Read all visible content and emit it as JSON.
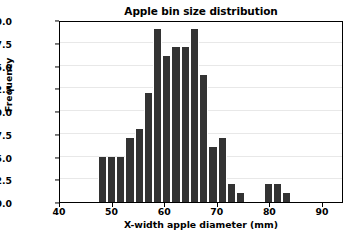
{
  "chart_data": {
    "type": "bar",
    "title": "Apple bin size distribution",
    "xlabel": "X-width apple diameter (mm)",
    "ylabel": "Frequency",
    "xlim": [
      40,
      94
    ],
    "ylim": [
      0,
      20
    ],
    "grid": true,
    "legend": null,
    "bar_color": "#333333",
    "bar_edge_color": "#ffffff",
    "bin_width": 1.75,
    "xticks": [
      40,
      50,
      60,
      70,
      80,
      90
    ],
    "xtick_labels": [
      "40",
      "50",
      "60",
      "70",
      "80",
      "90"
    ],
    "yticks": [
      0.0,
      2.5,
      5.0,
      7.5,
      10.0,
      12.5,
      15.0,
      17.5,
      20.0
    ],
    "ytick_labels": [
      "0.0",
      "2.5",
      "5.0",
      "7.5",
      "10.0",
      "12.5",
      "15.0",
      "17.5",
      "20.0"
    ],
    "bin_starts": [
      47.2,
      48.95,
      50.7,
      52.45,
      54.2,
      55.95,
      57.7,
      59.45,
      61.2,
      62.95,
      64.7,
      66.45,
      68.2,
      69.95,
      71.7,
      73.45,
      75.2,
      76.95,
      78.7,
      80.45,
      82.2,
      83.95,
      85.7,
      87.45
    ],
    "values": [
      5,
      5,
      5,
      7,
      8,
      12,
      19,
      16,
      17,
      17,
      19,
      14,
      6,
      7,
      2,
      1,
      0,
      0,
      2,
      2,
      1,
      0,
      0,
      0
    ],
    "categories": [
      "47.2",
      "49.0",
      "50.7",
      "52.5",
      "54.2",
      "56.0",
      "57.7",
      "59.5",
      "61.2",
      "63.0",
      "64.7",
      "66.5",
      "68.2",
      "70.0",
      "71.7",
      "73.5",
      "75.2",
      "77.0",
      "78.7",
      "80.5",
      "82.2",
      "84.0",
      "85.7",
      "87.5"
    ]
  }
}
